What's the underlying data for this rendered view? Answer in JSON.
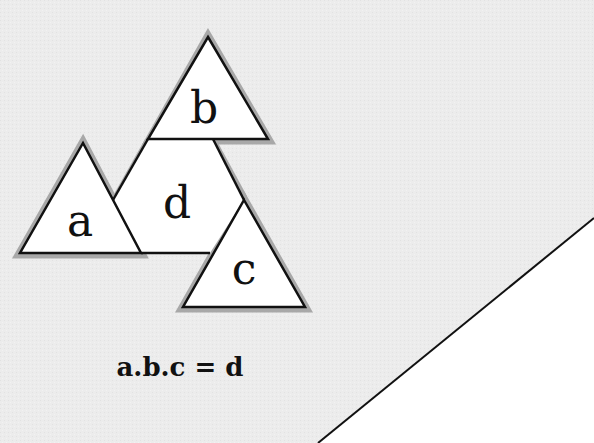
{
  "diagram": {
    "labels": {
      "a": "a",
      "b": "b",
      "c": "c",
      "d": "d"
    },
    "equation": "a.b.c = d",
    "colors": {
      "background": "#ececec",
      "fill": "#ffffff",
      "stroke": "#111111",
      "shadow": "#9a9a9a",
      "corner": "#ffffff"
    }
  }
}
